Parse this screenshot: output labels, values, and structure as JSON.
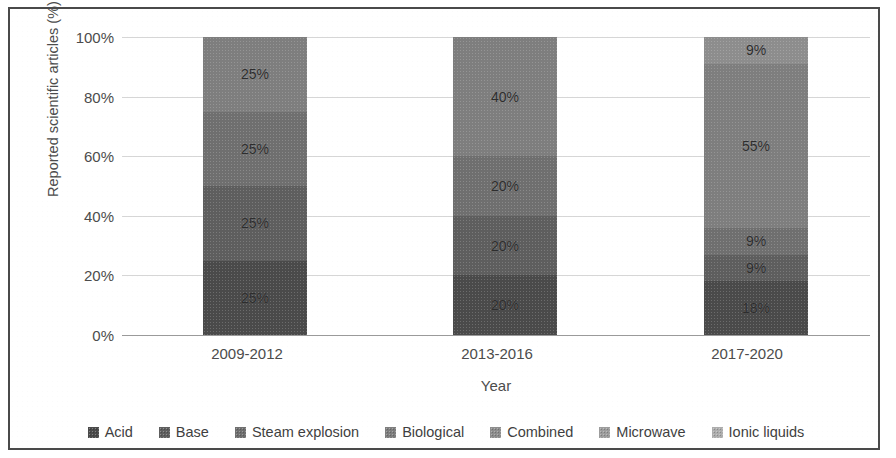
{
  "chart_data": {
    "type": "bar",
    "subtype": "stacked-100-percent",
    "title": "",
    "xlabel": "Year",
    "ylabel": "Reported scientific articles (%)",
    "categories": [
      "2009-2012",
      "2013-2016",
      "2017-2020"
    ],
    "ylim": [
      0,
      100
    ],
    "ytick_labels": [
      "0%",
      "20%",
      "40%",
      "60%",
      "80%",
      "100%"
    ],
    "ytick_values": [
      0,
      20,
      40,
      60,
      80,
      100
    ],
    "grid": true,
    "legend_position": "bottom",
    "series": [
      {
        "name": "Acid",
        "color": "#4a4a4a",
        "values": [
          25,
          20,
          18
        ],
        "labels": [
          "25%",
          "20%",
          "18%"
        ]
      },
      {
        "name": "Base",
        "color": "#5e5e5e",
        "values": [
          25,
          20,
          9
        ],
        "labels": [
          "25%",
          "20%",
          "9%"
        ]
      },
      {
        "name": "Steam explosion",
        "color": "#6f6f6f",
        "values": [
          25,
          20,
          9
        ],
        "labels": [
          "25%",
          "20%",
          "9%"
        ]
      },
      {
        "name": "Biological",
        "color": "#7e7e7e",
        "values": [
          25,
          40,
          55
        ],
        "labels": [
          "25%",
          "40%",
          "55%"
        ]
      },
      {
        "name": "Combined",
        "color": "#8d8d8d",
        "values": [
          0,
          0,
          9
        ],
        "labels": [
          "",
          "",
          "9%"
        ]
      },
      {
        "name": "Microwave",
        "color": "#9c9c9c",
        "values": [
          0,
          0,
          0
        ],
        "labels": [
          "",
          "",
          ""
        ]
      },
      {
        "name": "Ionic liquids",
        "color": "#adadad",
        "values": [
          0,
          0,
          0
        ],
        "labels": [
          "",
          "",
          ""
        ]
      }
    ]
  },
  "axis": {
    "y_title": "Reported scientific articles (%)",
    "x_title": "Year",
    "y_ticks": [
      "100%",
      "80%",
      "60%",
      "40%",
      "20%",
      "0%"
    ],
    "x_categories": [
      "2009-2012",
      "2013-2016",
      "2017-2020"
    ]
  },
  "legend": {
    "items": [
      {
        "label": "Acid",
        "color": "#4a4a4a"
      },
      {
        "label": "Base",
        "color": "#5e5e5e"
      },
      {
        "label": "Steam explosion",
        "color": "#6f6f6f"
      },
      {
        "label": "Biological",
        "color": "#7e7e7e"
      },
      {
        "label": "Combined",
        "color": "#8d8d8d"
      },
      {
        "label": "Microwave",
        "color": "#9c9c9c"
      },
      {
        "label": "Ionic liquids",
        "color": "#adadad"
      }
    ]
  },
  "style": {
    "border_color": "#4a4a4a",
    "gridline_color": "#d6d6d6",
    "baseline_color": "#9a9a9a",
    "text_color": "#4c4c4c",
    "background": "#ffffff"
  }
}
